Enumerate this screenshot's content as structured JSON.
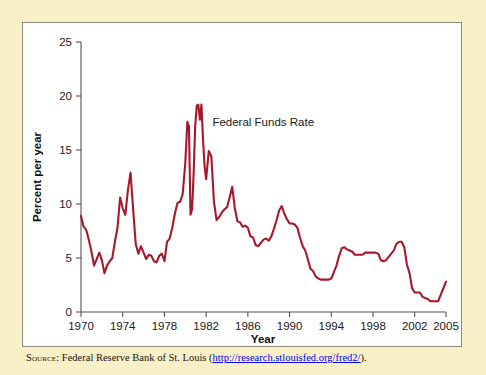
{
  "figure": {
    "source_label": "Source:",
    "source_text": "Federal Reserve Bank of St. Louis",
    "source_open_paren": "(",
    "source_url": "http://research.stlouisfed.org/fred2/",
    "source_close": ").",
    "page_background_color": "#FAF0C8",
    "plot_background_color": "#FFFFFF",
    "frame_border_color": "#8A8A80"
  },
  "chart_data": {
    "type": "line",
    "title": "",
    "series_label": "Federal Funds Rate",
    "line_color": "#A6182A",
    "xlabel": "Year",
    "ylabel": "Percent per year",
    "xlim": [
      1970,
      2005
    ],
    "ylim": [
      0,
      25
    ],
    "grid": false,
    "legend_position": "inline-annotation",
    "xticks": [
      1970,
      1974,
      1978,
      1982,
      1986,
      1990,
      1994,
      1998,
      2002,
      2005
    ],
    "xtick_labels": [
      "1970",
      "1974",
      "1978",
      "1982",
      "1986",
      "1990",
      "1994",
      "1998",
      "2002",
      "2005"
    ],
    "yticks": [
      0,
      5,
      10,
      15,
      20,
      25
    ],
    "ytick_labels": [
      "0",
      "5",
      "10",
      "15",
      "20",
      "25"
    ],
    "x": [
      1970.0,
      1970.25,
      1970.5,
      1970.75,
      1971.0,
      1971.25,
      1971.5,
      1971.75,
      1972.0,
      1972.25,
      1972.5,
      1972.75,
      1973.0,
      1973.25,
      1973.5,
      1973.75,
      1974.0,
      1974.25,
      1974.5,
      1974.75,
      1975.0,
      1975.25,
      1975.5,
      1975.75,
      1976.0,
      1976.25,
      1976.5,
      1976.75,
      1977.0,
      1977.25,
      1977.5,
      1977.75,
      1978.0,
      1978.25,
      1978.5,
      1978.75,
      1979.0,
      1979.25,
      1979.5,
      1979.75,
      1980.0,
      1980.2,
      1980.35,
      1980.5,
      1980.65,
      1980.8,
      1980.95,
      1981.1,
      1981.25,
      1981.4,
      1981.55,
      1981.7,
      1981.85,
      1982.0,
      1982.25,
      1982.5,
      1982.75,
      1983.0,
      1983.25,
      1983.5,
      1983.75,
      1984.0,
      1984.25,
      1984.5,
      1984.75,
      1985.0,
      1985.25,
      1985.5,
      1985.75,
      1986.0,
      1986.25,
      1986.5,
      1986.75,
      1987.0,
      1987.25,
      1987.5,
      1987.75,
      1988.0,
      1988.25,
      1988.5,
      1988.75,
      1989.0,
      1989.25,
      1989.5,
      1989.75,
      1990.0,
      1990.25,
      1990.5,
      1990.75,
      1991.0,
      1991.25,
      1991.5,
      1991.75,
      1992.0,
      1992.25,
      1992.5,
      1992.75,
      1993.0,
      1993.25,
      1993.5,
      1993.75,
      1994.0,
      1994.25,
      1994.5,
      1994.75,
      1995.0,
      1995.25,
      1995.5,
      1995.75,
      1996.0,
      1996.25,
      1996.5,
      1996.75,
      1997.0,
      1997.25,
      1997.5,
      1997.75,
      1998.0,
      1998.25,
      1998.5,
      1998.75,
      1999.0,
      1999.25,
      1999.5,
      1999.75,
      2000.0,
      2000.25,
      2000.5,
      2000.75,
      2001.0,
      2001.25,
      2001.5,
      2001.75,
      2002.0,
      2002.25,
      2002.5,
      2002.75,
      2003.0,
      2003.25,
      2003.5,
      2003.75,
      2004.0,
      2004.25,
      2004.5,
      2004.75,
      2005.0
    ],
    "values": [
      8.9,
      7.9,
      7.6,
      6.7,
      5.6,
      4.3,
      4.9,
      5.5,
      4.8,
      3.6,
      4.3,
      4.7,
      5.0,
      6.5,
      7.8,
      10.6,
      9.6,
      9.0,
      11.3,
      12.9,
      9.5,
      6.3,
      5.4,
      6.1,
      5.5,
      4.9,
      5.3,
      5.2,
      4.7,
      4.6,
      5.2,
      5.4,
      4.7,
      6.5,
      6.8,
      7.8,
      9.1,
      10.1,
      10.2,
      10.9,
      13.8,
      17.6,
      17.2,
      9.0,
      9.5,
      12.8,
      17.2,
      19.1,
      19.2,
      17.8,
      19.2,
      16.0,
      13.5,
      12.3,
      14.9,
      14.4,
      10.2,
      8.5,
      8.8,
      9.2,
      9.5,
      9.7,
      10.6,
      11.6,
      9.6,
      8.4,
      8.3,
      7.9,
      8.0,
      7.8,
      7.0,
      6.9,
      6.2,
      6.1,
      6.4,
      6.7,
      6.8,
      6.6,
      7.0,
      7.7,
      8.5,
      9.4,
      9.8,
      9.1,
      8.6,
      8.2,
      8.2,
      8.1,
      7.8,
      6.9,
      6.1,
      5.7,
      4.9,
      4.0,
      3.8,
      3.3,
      3.1,
      3.0,
      3.0,
      3.0,
      3.0,
      3.1,
      3.7,
      4.3,
      5.2,
      5.9,
      6.0,
      5.8,
      5.7,
      5.6,
      5.3,
      5.3,
      5.3,
      5.3,
      5.5,
      5.5,
      5.5,
      5.5,
      5.5,
      5.4,
      4.8,
      4.7,
      4.8,
      5.1,
      5.4,
      5.7,
      6.3,
      6.5,
      6.5,
      6.0,
      4.4,
      3.6,
      2.2,
      1.8,
      1.8,
      1.8,
      1.4,
      1.3,
      1.2,
      1.0,
      1.0,
      1.0,
      1.0,
      1.6,
      2.2,
      2.8
    ],
    "annotations": [
      {
        "text": "Federal Funds Rate",
        "x": 1982.6,
        "y": 17.2
      }
    ]
  }
}
